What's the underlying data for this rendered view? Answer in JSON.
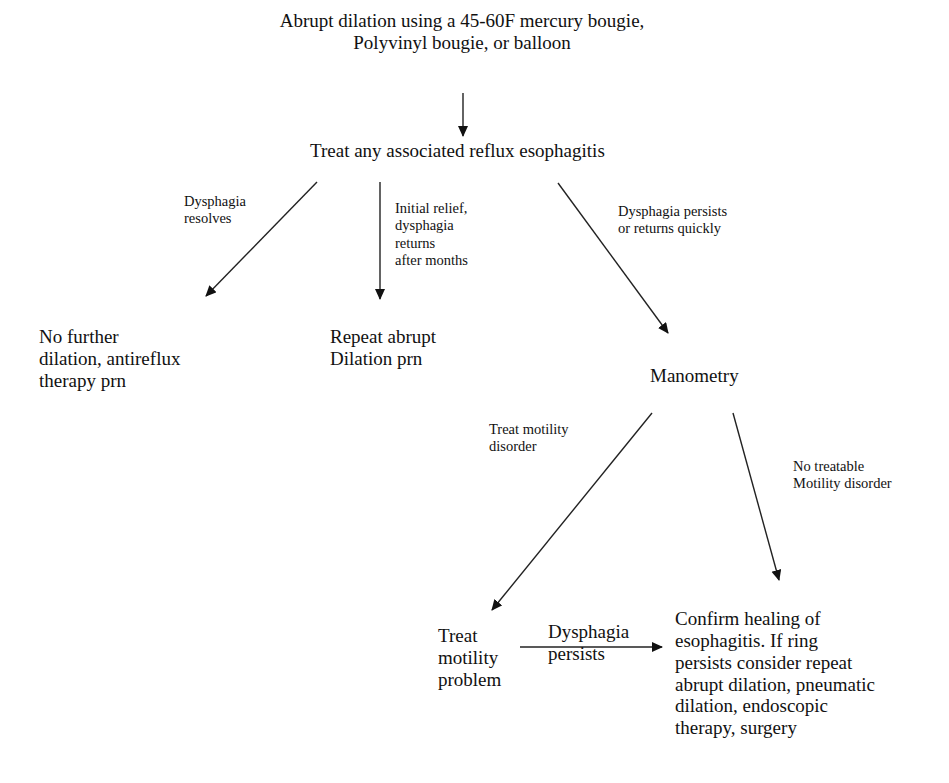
{
  "diagram": {
    "nodes": {
      "start": "Abrupt dilation using a 45-60F mercury bougie,\nPolyvinyl bougie, or balloon",
      "treat_reflux": "Treat any associated reflux esophagitis",
      "no_further": "No further\ndilation, antireflux\ntherapy prn",
      "repeat_abrupt": "Repeat abrupt\nDilation prn",
      "manometry": "Manometry",
      "treat_motility_problem": "Treat\nmotility\nproblem",
      "confirm_healing": "Confirm healing of\nesophagitis.  If ring\npersists consider repeat\nabrupt dilation, pneumatic\ndilation, endoscopic\ntherapy, surgery"
    },
    "edge_labels": {
      "dysphagia_resolves": "Dysphagia\nresolves",
      "initial_relief": "Initial relief,\ndysphagia\nreturns\nafter months",
      "persists_or_returns": "Dysphagia persists\nor returns quickly",
      "treat_motility_disorder": "Treat motility\ndisorder",
      "no_treatable": "No treatable\nMotility disorder",
      "dysphagia_persists": "Dysphagia\npersists"
    },
    "edges": [
      {
        "from": "start",
        "to": "treat_reflux",
        "label": ""
      },
      {
        "from": "treat_reflux",
        "to": "no_further",
        "label": "Dysphagia resolves"
      },
      {
        "from": "treat_reflux",
        "to": "repeat_abrupt",
        "label": "Initial relief, dysphagia returns after months"
      },
      {
        "from": "treat_reflux",
        "to": "manometry",
        "label": "Dysphagia persists or returns quickly"
      },
      {
        "from": "manometry",
        "to": "treat_motility_problem",
        "label": "Treat motility disorder"
      },
      {
        "from": "manometry",
        "to": "confirm_healing",
        "label": "No treatable Motility disorder"
      },
      {
        "from": "treat_motility_problem",
        "to": "confirm_healing",
        "label": "Dysphagia persists"
      }
    ]
  }
}
